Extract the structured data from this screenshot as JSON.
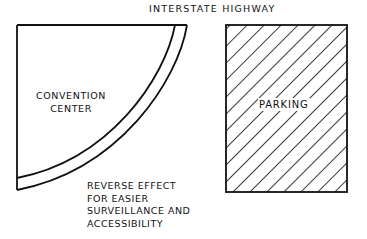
{
  "diagram": {
    "title": "INTERSTATE HIGHWAY",
    "shapes": [
      {
        "id": "convention-center",
        "label_lines": [
          "CONVENTION",
          "CENTER"
        ],
        "shape": "quarter-circle with curved band (road/walkway) along arc",
        "fill": "none"
      },
      {
        "id": "parking",
        "label": "PARKING",
        "shape": "rectangle",
        "fill": "diagonal-hatch"
      }
    ],
    "annotation": {
      "lines": [
        "REVERSE EFFECT",
        "FOR EASIER",
        "SURVEILLANCE AND",
        "ACCESSIBILITY"
      ]
    }
  },
  "colors": {
    "ink": "#111111",
    "background": "#ffffff"
  }
}
